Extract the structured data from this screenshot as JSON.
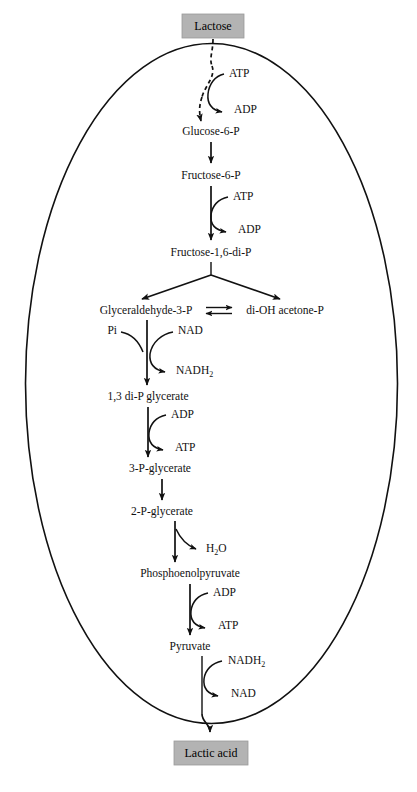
{
  "diagram": {
    "cell_boundary": "ellipse",
    "colors": {
      "box_fill": "#b3b3b3",
      "line": "#111111",
      "background": "#ffffff"
    },
    "boxes": [
      {
        "id": "lactose",
        "label": "Lactose"
      },
      {
        "id": "lactic_acid",
        "label": "Lactic acid"
      }
    ],
    "metabolites": [
      {
        "id": "glucose6p",
        "label": "Glucose-6-P"
      },
      {
        "id": "fructose6p",
        "label": "Fructose-6-P"
      },
      {
        "id": "fructose16dip",
        "label": "Fructose-1,6-di-P"
      },
      {
        "id": "g3p",
        "label": "Glyceraldehyde-3-P"
      },
      {
        "id": "dhap",
        "label": "di-OH acetone-P"
      },
      {
        "id": "bpg",
        "label": "1,3 di-P glycerate"
      },
      {
        "id": "pg3",
        "label": "3-P-glycerate"
      },
      {
        "id": "pg2",
        "label": "2-P-glycerate"
      },
      {
        "id": "pep",
        "label": "Phosphoenolpyruvate"
      },
      {
        "id": "pyruvate",
        "label": "Pyruvate"
      }
    ],
    "cofactors": [
      {
        "id": "atp_in_1",
        "label": "ATP",
        "role": "substrate"
      },
      {
        "id": "adp_out_1",
        "label": "ADP",
        "role": "product"
      },
      {
        "id": "atp_in_2",
        "label": "ATP",
        "role": "substrate"
      },
      {
        "id": "adp_out_2",
        "label": "ADP",
        "role": "product"
      },
      {
        "id": "pi_in",
        "label": "Pi",
        "role": "substrate"
      },
      {
        "id": "nad_in",
        "label": "NAD",
        "role": "substrate"
      },
      {
        "id": "nadh2_out",
        "label": "NADH",
        "sub": "2",
        "role": "product"
      },
      {
        "id": "adp_in_3",
        "label": "ADP",
        "role": "substrate"
      },
      {
        "id": "atp_out_3",
        "label": "ATP",
        "role": "product"
      },
      {
        "id": "h2o_out",
        "label": "H",
        "sub": "2",
        "label_tail": "O",
        "role": "product"
      },
      {
        "id": "adp_in_4",
        "label": "ADP",
        "role": "substrate"
      },
      {
        "id": "atp_out_4",
        "label": "ATP",
        "role": "product"
      },
      {
        "id": "nadh2_in",
        "label": "NADH",
        "sub": "2",
        "role": "substrate"
      },
      {
        "id": "nad_out",
        "label": "NAD",
        "role": "product"
      }
    ],
    "text": {
      "lactose": "Lactose",
      "lactic_acid": "Lactic acid",
      "glucose6p": "Glucose-6-P",
      "fructose6p": "Fructose-6-P",
      "fructose16dip": "Fructose-1,6-di-P",
      "g3p": "Glyceraldehyde-3-P",
      "dhap": "di-OH acetone-P",
      "bpg": "1,3 di-P glycerate",
      "pg3": "3-P-glycerate",
      "pg2": "2-P-glycerate",
      "pep": "Phosphoenolpyruvate",
      "pyruvate": "Pyruvate",
      "atp1": "ATP",
      "adp1": "ADP",
      "atp2": "ATP",
      "adp2": "ADP",
      "pi": "Pi",
      "nad1": "NAD",
      "nadh2_1": "NADH",
      "nadh2_1_sub": "2",
      "adp3": "ADP",
      "atp3": "ATP",
      "h2o_main": "H",
      "h2o_sub": "2",
      "h2o_tail": "O",
      "adp4": "ADP",
      "atp4": "ATP",
      "nadh2_2": "NADH",
      "nadh2_2_sub": "2",
      "nad2": "NAD"
    }
  }
}
